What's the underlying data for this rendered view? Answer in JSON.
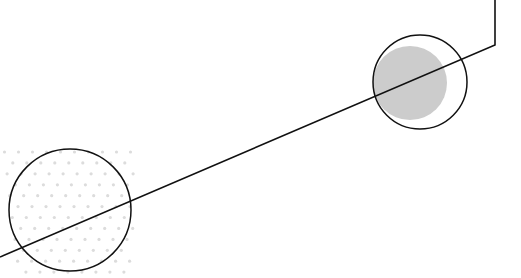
{
  "canvas": {
    "width": 521,
    "height": 278,
    "background": "#ffffff"
  },
  "colors": {
    "stroke": "#111111",
    "gray_fill": "#cccccc",
    "dot": "#dcdcdc"
  },
  "shapes": {
    "polyline": {
      "points": "495,0 495,45 0,257",
      "stroke_width": 1.6
    },
    "right_outline_circle": {
      "cx": 420,
      "cy": 82,
      "r": 47,
      "stroke_width": 1.5
    },
    "right_filled_circle": {
      "cx": 410,
      "cy": 83,
      "r": 37
    },
    "left_outline_circle": {
      "cx": 70,
      "cy": 210,
      "r": 61,
      "stroke_width": 1.5
    },
    "dot_field": {
      "x0": 0,
      "y0": 148,
      "x1": 135,
      "y1": 278,
      "spacing": 14,
      "r": 1.6
    }
  }
}
